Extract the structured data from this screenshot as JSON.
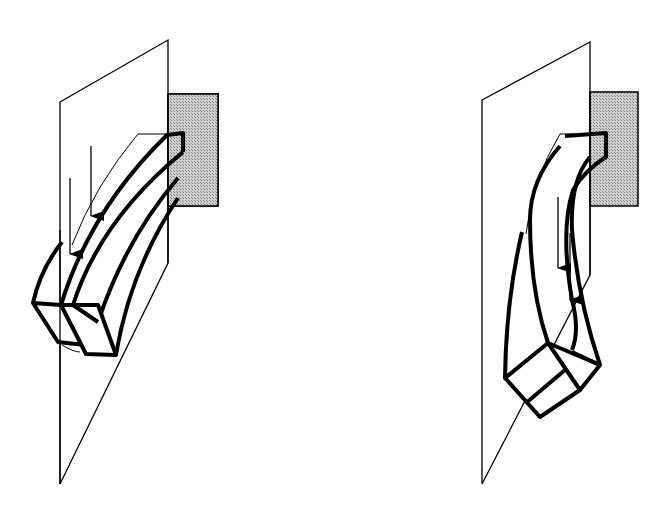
{
  "figure": {
    "description": "Two schematic panels showing a cantilever beam attached to a wall plate, bending in two different modes",
    "panels": [
      {
        "id": "left",
        "label": "Cantilever bending in vertical plane (two parallel layers)",
        "arrows": 2,
        "arrow_direction": "down"
      },
      {
        "id": "right",
        "label": "Cantilever bending with twist (two layers)",
        "arrows": 2,
        "arrow_direction": "down"
      }
    ],
    "colors": {
      "stroke": "#000000",
      "background": "#ffffff",
      "wall_fill": "#bdbdbd"
    }
  }
}
